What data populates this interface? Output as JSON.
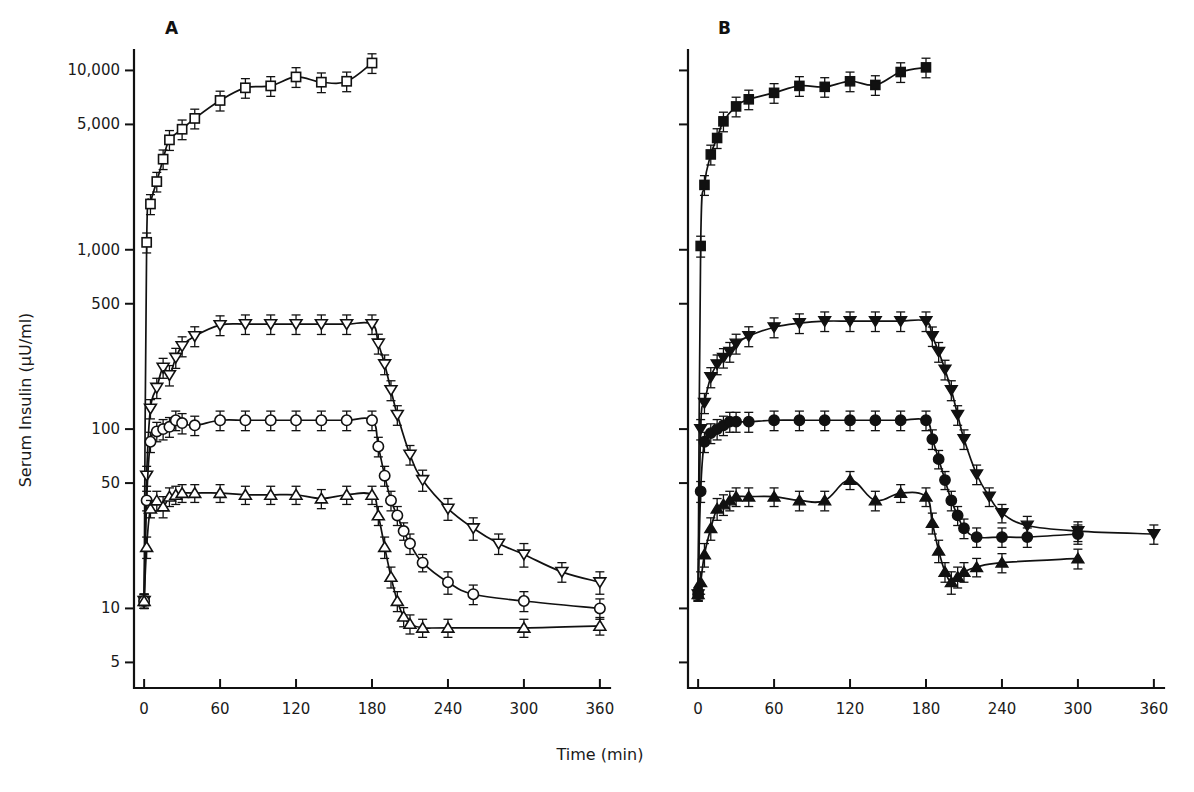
{
  "figure": {
    "xlabel": "Time (min)",
    "ylabel": "Serum Insulin (μU/ml)",
    "panelA_letter": "A",
    "panelB_letter": "B"
  },
  "chart_data": {
    "type": "line",
    "title": "",
    "xlabel": "Time (min)",
    "ylabel": "Serum Insulin (μU/ml)",
    "yscale": "log",
    "ylim": [
      3.6,
      13000
    ],
    "xlim": [
      -8,
      368
    ],
    "xticks": [
      0,
      60,
      120,
      180,
      240,
      300,
      360
    ],
    "xticklabels": [
      "0",
      "60",
      "120",
      "180",
      "240",
      "300",
      "360"
    ],
    "yticks": [
      5,
      10,
      50,
      100,
      500,
      1000,
      5000,
      10000
    ],
    "yticklabels": [
      "5",
      "10",
      "50",
      "100",
      "500",
      "1,000",
      "5,000",
      "10,000"
    ],
    "grid": false,
    "legend_position": "none",
    "panels": [
      {
        "name": "A",
        "label": "A",
        "marker_style": "open",
        "series": [
          {
            "name": "open-square",
            "marker": "square-open",
            "x": [
              0,
              2,
              5,
              10,
              15,
              20,
              30,
              40,
              60,
              80,
              100,
              120,
              140,
              160,
              180
            ],
            "y": [
              11,
              1100,
              1800,
              2400,
              3200,
              4100,
              4700,
              5400,
              6800,
              8000,
              8200,
              9200,
              8600,
              8700,
              11000
            ],
            "yerr_lo": [
              1,
              140,
              230,
              300,
              400,
              520,
              590,
              680,
              860,
              1000,
              1030,
              1160,
              1080,
              1090,
              1380
            ],
            "yerr_hi": [
              1,
              140,
              230,
              300,
              400,
              520,
              590,
              680,
              860,
              1000,
              1030,
              1160,
              1080,
              1090,
              1380
            ]
          },
          {
            "name": "open-triangle-down",
            "marker": "triangle-down-open",
            "x": [
              0,
              2,
              5,
              10,
              15,
              20,
              25,
              30,
              40,
              60,
              80,
              100,
              120,
              140,
              160,
              180,
              185,
              190,
              195,
              200,
              210,
              220,
              240,
              260,
              280,
              300,
              330,
              360
            ],
            "y": [
              11,
              55,
              130,
              170,
              220,
              200,
              250,
              290,
              330,
              380,
              385,
              385,
              385,
              385,
              385,
              385,
              300,
              230,
              165,
              120,
              72,
              52,
              36,
              28,
              23,
              20,
              16,
              14
            ],
            "yerr_lo": [
              1,
              7,
              16,
              22,
              28,
              26,
              32,
              37,
              42,
              48,
              48,
              48,
              48,
              48,
              48,
              48,
              38,
              29,
              21,
              15,
              9,
              7,
              5,
              4,
              3,
              3,
              2,
              2
            ],
            "yerr_hi": [
              1,
              7,
              16,
              22,
              28,
              26,
              32,
              37,
              42,
              48,
              48,
              48,
              48,
              48,
              48,
              48,
              38,
              29,
              21,
              15,
              9,
              7,
              5,
              4,
              3,
              3,
              2,
              2
            ]
          },
          {
            "name": "open-circle",
            "marker": "circle-open",
            "x": [
              0,
              2,
              5,
              10,
              15,
              20,
              25,
              30,
              40,
              60,
              80,
              100,
              120,
              140,
              160,
              180,
              185,
              190,
              195,
              200,
              205,
              210,
              220,
              240,
              260,
              300,
              360
            ],
            "y": [
              11,
              40,
              85,
              97,
              100,
              103,
              112,
              108,
              105,
              112,
              112,
              112,
              112,
              112,
              112,
              112,
              80,
              55,
              40,
              33,
              27,
              23,
              18,
              14,
              12,
              11,
              10
            ],
            "yerr_lo": [
              1,
              5,
              11,
              12,
              13,
              13,
              14,
              14,
              13,
              14,
              14,
              14,
              14,
              14,
              14,
              14,
              10,
              7,
              5,
              4,
              3,
              3,
              2,
              2,
              1.5,
              1.4,
              1.3
            ],
            "yerr_hi": [
              1,
              5,
              11,
              12,
              13,
              13,
              14,
              14,
              13,
              14,
              14,
              14,
              14,
              14,
              14,
              14,
              10,
              7,
              5,
              4,
              3,
              3,
              2,
              2,
              1.5,
              1.4,
              1.3
            ]
          },
          {
            "name": "open-triangle-up",
            "marker": "triangle-up-open",
            "x": [
              0,
              2,
              5,
              10,
              15,
              20,
              25,
              30,
              40,
              60,
              80,
              100,
              120,
              140,
              160,
              180,
              185,
              190,
              195,
              200,
              205,
              210,
              220,
              240,
              300,
              360
            ],
            "y": [
              11,
              22,
              36,
              40,
              37,
              42,
              43,
              44,
              44,
              44,
              43,
              43,
              43,
              41,
              43,
              43,
              33,
              22,
              15,
              11,
              9,
              8.2,
              7.8,
              7.8,
              7.8,
              8.0
            ],
            "yerr_lo": [
              1,
              3,
              4,
              5,
              5,
              5,
              5,
              5,
              5,
              5,
              5,
              5,
              5,
              5,
              5,
              5,
              4,
              3,
              2,
              1.4,
              1.1,
              1.0,
              0.9,
              0.9,
              0.9,
              0.9
            ],
            "yerr_hi": [
              1,
              3,
              4,
              5,
              5,
              5,
              5,
              5,
              5,
              5,
              5,
              5,
              5,
              5,
              5,
              5,
              4,
              3,
              2,
              1.4,
              1.1,
              1.0,
              0.9,
              0.9,
              0.9,
              0.9
            ]
          }
        ]
      },
      {
        "name": "B",
        "label": "B",
        "marker_style": "filled",
        "series": [
          {
            "name": "filled-square",
            "marker": "square-filled",
            "x": [
              0,
              2,
              5,
              10,
              15,
              20,
              30,
              40,
              60,
              80,
              100,
              120,
              140,
              160,
              180
            ],
            "y": [
              12,
              1050,
              2300,
              3400,
              4200,
              5200,
              6300,
              6900,
              7500,
              8200,
              8100,
              8700,
              8300,
              9800,
              10400
            ],
            "yerr_lo": [
              1,
              140,
              290,
              430,
              530,
              650,
              790,
              860,
              940,
              1030,
              1010,
              1090,
              1040,
              1230,
              1300
            ],
            "yerr_hi": [
              1,
              140,
              290,
              430,
              530,
              650,
              790,
              860,
              940,
              1030,
              1010,
              1090,
              1040,
              1230,
              1300
            ]
          },
          {
            "name": "filled-triangle-down",
            "marker": "triangle-down-filled",
            "x": [
              0,
              2,
              5,
              10,
              15,
              20,
              25,
              30,
              40,
              60,
              80,
              100,
              120,
              140,
              160,
              180,
              185,
              190,
              195,
              200,
              205,
              210,
              220,
              230,
              240,
              260,
              300,
              360
            ],
            "y": [
              12,
              100,
              140,
              195,
              230,
              250,
              270,
              300,
              330,
              370,
              390,
              400,
              400,
              400,
              400,
              400,
              330,
              270,
              215,
              165,
              120,
              88,
              56,
              42,
              34,
              29,
              27,
              26
            ],
            "yerr_lo": [
              1,
              13,
              18,
              25,
              29,
              31,
              34,
              38,
              42,
              47,
              49,
              50,
              50,
              50,
              50,
              50,
              41,
              34,
              27,
              21,
              15,
              11,
              7,
              5,
              4,
              3.6,
              3.4,
              3.2
            ],
            "yerr_hi": [
              1,
              13,
              18,
              25,
              29,
              31,
              34,
              38,
              42,
              47,
              49,
              50,
              50,
              50,
              50,
              50,
              41,
              34,
              27,
              21,
              15,
              11,
              7,
              5,
              4,
              3.6,
              3.4,
              3.2
            ]
          },
          {
            "name": "filled-circle",
            "marker": "circle-filled",
            "x": [
              0,
              2,
              5,
              10,
              15,
              20,
              25,
              30,
              40,
              60,
              80,
              100,
              120,
              140,
              160,
              180,
              185,
              190,
              195,
              200,
              205,
              210,
              220,
              240,
              260,
              300
            ],
            "y": [
              12,
              45,
              85,
              95,
              100,
              105,
              110,
              110,
              110,
              112,
              112,
              112,
              112,
              112,
              112,
              112,
              88,
              68,
              52,
              40,
              33,
              28,
              25,
              25,
              25,
              26
            ],
            "yerr_lo": [
              1,
              6,
              11,
              12,
              13,
              13,
              14,
              14,
              14,
              14,
              14,
              14,
              14,
              14,
              14,
              14,
              11,
              8,
              6,
              5,
              4,
              3.5,
              3.1,
              3.1,
              3.1,
              3.2
            ],
            "yerr_hi": [
              1,
              6,
              11,
              12,
              13,
              13,
              14,
              14,
              14,
              14,
              14,
              14,
              14,
              14,
              14,
              14,
              11,
              8,
              6,
              5,
              4,
              3.5,
              3.1,
              3.1,
              3.1,
              3.2
            ]
          },
          {
            "name": "filled-triangle-up",
            "marker": "triangle-up-filled",
            "x": [
              0,
              2,
              5,
              10,
              15,
              20,
              25,
              30,
              40,
              60,
              80,
              100,
              120,
              140,
              160,
              180,
              185,
              190,
              195,
              200,
              205,
              210,
              220,
              240,
              300
            ],
            "y": [
              12,
              14,
              20,
              28,
              36,
              38,
              40,
              42,
              42,
              42,
              40,
              40,
              52,
              40,
              44,
              42,
              30,
              21,
              16,
              14,
              15,
              16,
              17,
              18,
              19
            ],
            "yerr_lo": [
              1,
              2,
              3,
              4,
              5,
              5,
              5,
              5,
              5,
              5,
              5,
              5,
              6,
              5,
              5,
              5,
              4,
              3,
              2,
              2,
              2,
              2,
              2,
              2.2,
              2.4
            ],
            "yerr_hi": [
              1,
              2,
              3,
              4,
              5,
              5,
              5,
              5,
              5,
              5,
              5,
              5,
              6,
              5,
              5,
              5,
              4,
              3,
              2,
              2,
              2,
              2,
              2,
              2.2,
              2.4
            ]
          }
        ]
      }
    ]
  }
}
